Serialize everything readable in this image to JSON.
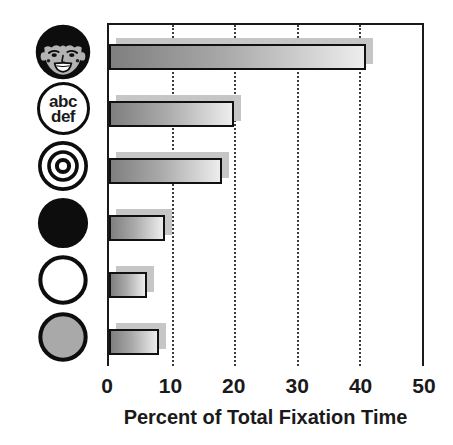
{
  "chart_data": {
    "type": "bar",
    "orientation": "horizontal",
    "title": "",
    "xlabel": "Percent of Total Fixation Time",
    "ylabel": "",
    "xlim": [
      0,
      50
    ],
    "x_ticks": [
      0,
      10,
      20,
      30,
      40,
      50
    ],
    "grid": "vertical dotted gridlines at 10, 20, 30 and 40; solid frame on top, left and right; no bottom axis line",
    "legend": "none",
    "categories": [
      "face",
      "text-abc-def",
      "bullseye",
      "black-circle",
      "white-circle",
      "gray-circle"
    ],
    "values": [
      41,
      20,
      18,
      9,
      6,
      8
    ],
    "bar_height_px": 26,
    "bar_fill": "gray gradient, dark at left to light at right, each bar with offset light-gray drop shadow up and to the right"
  },
  "icons": {
    "text_line1": "abc",
    "text_line2": "def",
    "names": [
      "face-icon",
      "text-abc-def-icon",
      "bullseye-icon",
      "black-circle-icon",
      "white-circle-icon",
      "gray-circle-icon"
    ]
  },
  "colors": {
    "background": "#ffffff",
    "axis_and_border": "#1a1a1a",
    "gridline": "#3c3c3c",
    "bar_border": "#111111",
    "bar_gradient_start": "#7f7f7f",
    "bar_gradient_end": "#ededed",
    "bar_shadow": "#c6c6c6",
    "gray_circle_fill": "#a9a9a9",
    "face_skin": "#b3b3b3",
    "text": "#1a1a1a"
  }
}
